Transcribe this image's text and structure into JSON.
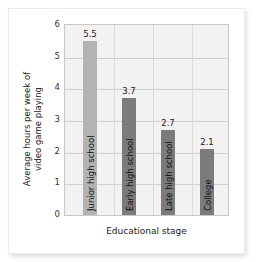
{
  "chart_data": {
    "type": "bar",
    "title": "",
    "categories": [
      "Junior high school",
      "Early high school",
      "Late high school",
      "College"
    ],
    "values": [
      5.5,
      3.7,
      2.7,
      2.1
    ],
    "data_labels": [
      "5.5",
      "3.7",
      "2.7",
      "2.1"
    ],
    "xlabel": "Educational stage",
    "ylabel": "Average hours per week of video game playing",
    "ylim": [
      0,
      6
    ],
    "yticks": [
      "0",
      "1",
      "2",
      "3",
      "4",
      "5",
      "6"
    ],
    "grid": true,
    "legend": null,
    "colors": [
      "#b3b3b3",
      "#7b7b7b",
      "#7b7b7b",
      "#7b7b7b"
    ]
  },
  "axes": {
    "ylabel_line1": "Average hours per week of",
    "ylabel_line2": "video game playing",
    "xlabel": "Educational stage"
  }
}
